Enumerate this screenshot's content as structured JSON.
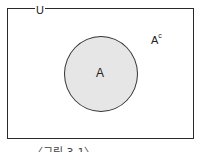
{
  "diagram": {
    "universe_label": "U",
    "set_label": "A",
    "complement_label": "A",
    "complement_superscript": "c",
    "caption": "〈그림 3-1〉",
    "colors": {
      "set_fill": "#e6e6e6",
      "border": "#2a2a2a",
      "background": "#ffffff"
    }
  }
}
